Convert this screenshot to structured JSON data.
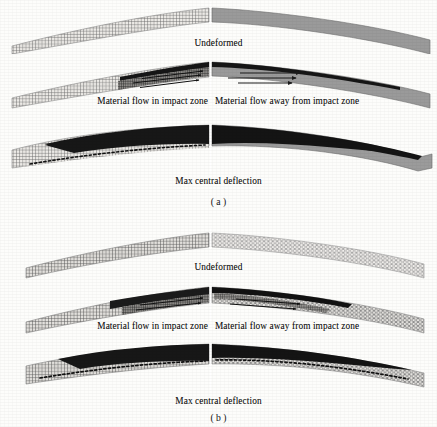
{
  "figure": {
    "panels": [
      {
        "id": "a",
        "label": "( a )",
        "rows": [
          {
            "name": "undeformed",
            "caption_center": "Undeformed",
            "left_fill": "fine-square-mesh",
            "right_fill": "solid-gray"
          },
          {
            "name": "material-flow",
            "caption_left": "Material flow in impact zone",
            "caption_right": "Material flow away from impact zone",
            "left_fill": "fine-square-mesh-with-dark-top-band",
            "right_fill": "solid-gray-with-dark-top-band",
            "arrows_left": 3,
            "arrows_right": 3,
            "arrow_direction": "right"
          },
          {
            "name": "max-deflection",
            "caption_center": "Max central deflection",
            "left_fill": "fine-square-mesh-with-dark-wedge",
            "right_fill": "dark-wedge-over-gray",
            "dotted_baseline": true
          }
        ]
      },
      {
        "id": "b",
        "label": "( b )",
        "rows": [
          {
            "name": "undeformed",
            "caption_center": "Undeformed",
            "left_fill": "fine-square-mesh",
            "right_fill": "light-honeycomb-mesh"
          },
          {
            "name": "material-flow",
            "caption_left": "Material flow in impact zone",
            "caption_right": "Material flow away from impact zone",
            "left_fill": "fine-square-mesh-with-dark-top-band",
            "right_fill": "light-honeycomb-mesh-with-dark-top-band",
            "arrows_left": 2,
            "arrows_right": 2,
            "arrow_direction": "right"
          },
          {
            "name": "max-deflection",
            "caption_center": "Max central deflection",
            "left_fill": "fine-square-mesh-with-dark-wedge",
            "right_fill": "honeycomb-mesh-with-dark-wedge",
            "dotted_baseline": true
          }
        ]
      }
    ],
    "colors": {
      "background": "#fdfdfb",
      "solid_gray": "#9a9a9a",
      "dark_fill": "#151515",
      "mesh_line": "#6f6f6f",
      "light_mesh_line": "#9c9c9c",
      "text": "#111111",
      "divider": "#ffffff"
    }
  }
}
